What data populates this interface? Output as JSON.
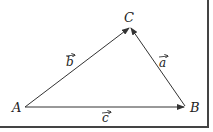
{
  "diagram": {
    "title": "",
    "points": [
      {
        "id": "A",
        "label": "A",
        "x": 25,
        "y": 107
      },
      {
        "id": "B",
        "label": "B",
        "x": 185,
        "y": 107
      },
      {
        "id": "C",
        "label": "C",
        "x": 130,
        "y": 27
      }
    ],
    "vectors": [
      {
        "id": "b",
        "label": "b",
        "from": "A",
        "to": "C"
      },
      {
        "id": "a",
        "label": "a",
        "from": "B",
        "to": "C"
      },
      {
        "id": "c",
        "label": "c",
        "from": "A",
        "to": "B"
      }
    ],
    "colors": {
      "line": "#333333",
      "border": "#444444",
      "background": "#ffffff"
    }
  }
}
